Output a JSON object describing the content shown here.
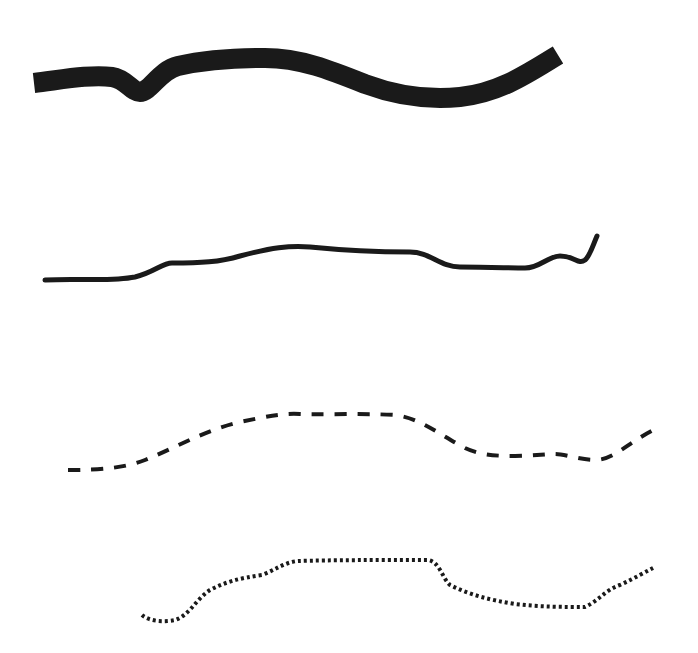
{
  "diagram": {
    "title": "",
    "stroke_color": "#1a1a1a",
    "background": "#ffffff",
    "lines": [
      {
        "name": "thick-line",
        "style": "thick",
        "stroke_width": 20,
        "dasharray": "",
        "linecap": "butt",
        "path": "M 34 83 C 60 80, 90 74, 112 77 C 126 79, 132 92, 140 92 C 150 92, 160 70, 178 66 C 205 60, 230 58, 265 58 C 300 58, 330 70, 365 84 C 400 97, 430 100, 460 97 C 500 93, 530 72, 558 55"
      },
      {
        "name": "solid-line",
        "style": "solid",
        "stroke_width": 5,
        "dasharray": "",
        "linecap": "round",
        "path": "M 45 280 C 80 278, 110 282, 135 277 C 155 272, 162 263, 172 263 C 200 263, 220 262, 240 256 C 270 248, 290 245, 310 247 C 340 250, 370 252, 410 252 C 430 252, 440 267, 460 267 C 490 267, 510 268, 525 268 C 540 268, 548 256, 560 256 C 575 256, 578 265, 585 260 C 590 256, 593 245, 597 236"
      },
      {
        "name": "dashed-line",
        "style": "dashed",
        "stroke_width": 4,
        "dasharray": "12 11",
        "linecap": "butt",
        "path": "M 68 470 C 100 470, 125 468, 145 460 C 175 448, 205 430, 240 422 C 265 417, 280 413, 300 414 C 330 415, 360 413, 395 415 C 420 418, 440 435, 465 448 C 480 455, 495 456, 515 456 C 530 456, 545 454, 555 454 C 565 454, 580 460, 595 460 C 615 460, 630 440, 660 427"
      },
      {
        "name": "dotted-line",
        "style": "dotted",
        "stroke_width": 4,
        "dasharray": "3 3",
        "linecap": "butt",
        "path": "M 142 615 C 150 622, 165 622, 175 620 C 190 615, 195 600, 210 590 C 225 582, 240 578, 262 575 C 275 570, 285 562, 298 561 C 330 560, 380 560, 428 560 C 440 562, 442 578, 450 585 C 470 595, 490 600, 515 604 C 540 607, 565 607, 585 607 C 600 600, 605 590, 620 585 C 635 578, 645 572, 655 567"
      }
    ]
  }
}
